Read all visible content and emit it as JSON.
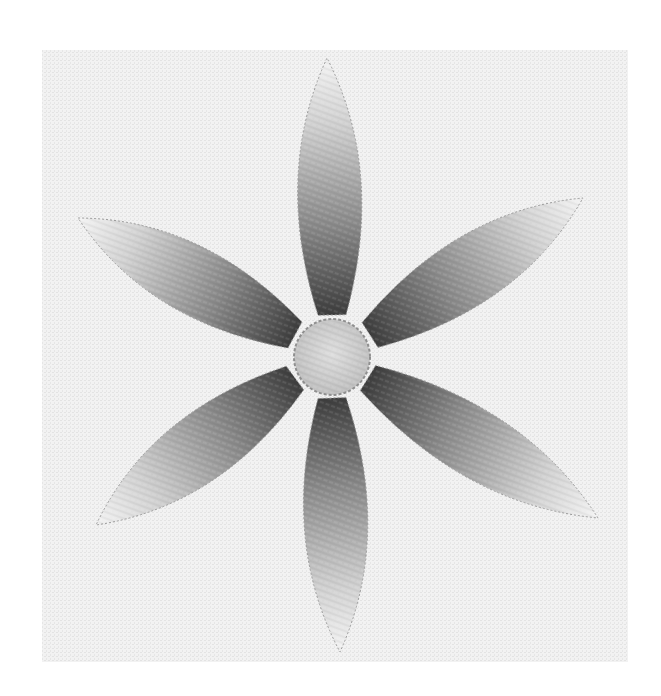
{
  "image": {
    "description": "Embroidered six-petal flower in grayscale thread painting on white linen",
    "width": 661,
    "height": 696,
    "background": "#ffffff"
  },
  "fabric": {
    "x": 42,
    "y": 50,
    "width": 586,
    "height": 612,
    "color": "#f1f1f1",
    "weave_color": "#e2e2e2"
  },
  "flower": {
    "center": {
      "x": 332,
      "y": 357
    },
    "petals": [
      {
        "name": "top",
        "tip": [
          327,
          58
        ],
        "base": [
          332,
          315
        ],
        "width": 112,
        "dark_at": "base"
      },
      {
        "name": "upper-right",
        "tip": [
          583,
          198
        ],
        "base": [
          370,
          335
        ],
        "width": 118,
        "dark_at": "base"
      },
      {
        "name": "lower-right",
        "tip": [
          598,
          518
        ],
        "base": [
          368,
          378
        ],
        "width": 118,
        "dark_at": "base"
      },
      {
        "name": "bottom",
        "tip": [
          340,
          652
        ],
        "base": [
          332,
          398
        ],
        "width": 112,
        "dark_at": "base"
      },
      {
        "name": "lower-left",
        "tip": [
          96,
          525
        ],
        "base": [
          295,
          378
        ],
        "width": 118,
        "dark_at": "base"
      },
      {
        "name": "upper-left",
        "tip": [
          78,
          218
        ],
        "base": [
          295,
          335
        ],
        "width": 118,
        "dark_at": "base"
      }
    ],
    "petal_colors": {
      "dark": "#3e3e3e",
      "mid": "#8a8a8a",
      "light": "#f4f4f4"
    },
    "center_disc": {
      "radius": 38,
      "fill": "#cfcfcf",
      "outline": "#8f8f8f"
    }
  }
}
